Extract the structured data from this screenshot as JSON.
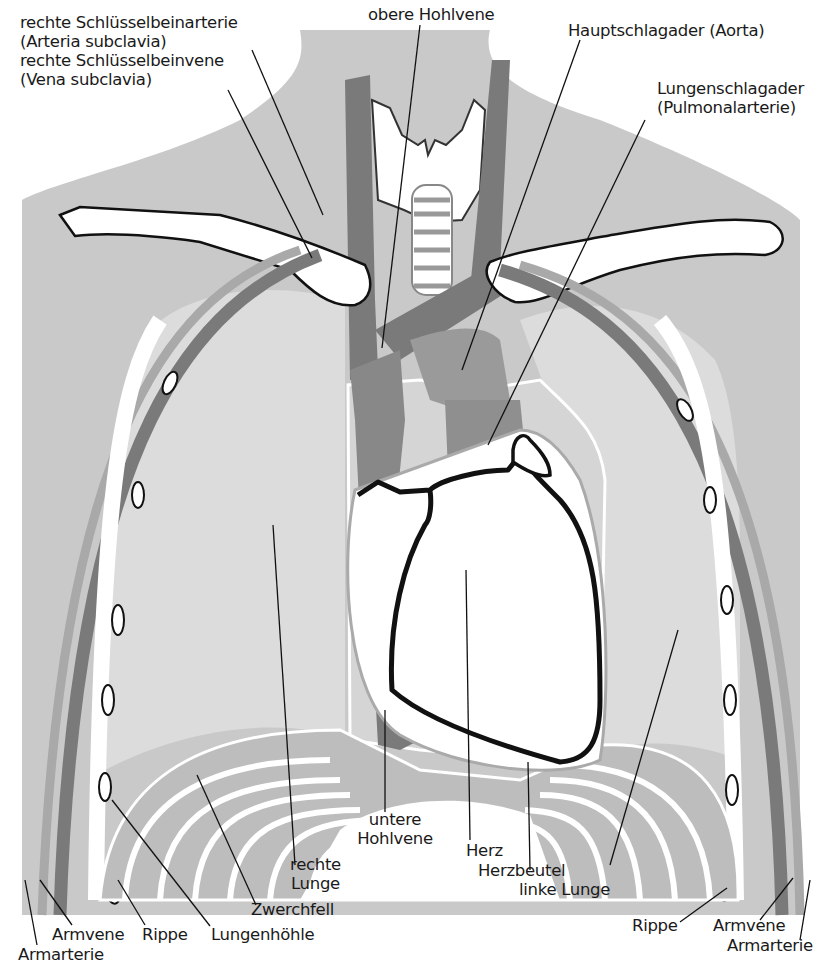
{
  "diagram": {
    "colors": {
      "background": "#ffffff",
      "body": "#c9c9c9",
      "lung": "#dcdcdc",
      "vein": "#7a7a7a",
      "artery": "#a9a9a9",
      "bone": "#ffffff",
      "outline": "#111111",
      "diaphragm_band": "#bdbdbd"
    },
    "labels": {
      "subclavian_artery": {
        "line1": "rechte Schlüsselbeinarterie",
        "line2": "(Arteria subclavia)"
      },
      "subclavian_vein": {
        "line1": "rechte Schlüsselbeinvene",
        "line2": "(Vena subclavia)"
      },
      "superior_vena_cava": {
        "line1": "obere Hohlvene"
      },
      "aorta": {
        "line1": "Hauptschlagader (Aorta)"
      },
      "pulmonary_artery": {
        "line1": "Lungenschlagader",
        "line2": "(Pulmonalarterie)"
      },
      "inferior_vena_cava": {
        "line1": "untere",
        "line2": "Hohlvene"
      },
      "heart": {
        "line1": "Herz"
      },
      "pericardium": {
        "line1": "Herzbeutel"
      },
      "right_lung": {
        "line1": "rechte",
        "line2": "Lunge"
      },
      "left_lung": {
        "line1": "linke Lunge"
      },
      "diaphragm": {
        "line1": "Zwerchfell"
      },
      "pleural_cavity": {
        "line1": "Lungenhöhle"
      },
      "rib_left": {
        "line1": "Rippe"
      },
      "rib_right": {
        "line1": "Rippe"
      },
      "arm_vein_left": {
        "line1": "Armvene"
      },
      "arm_vein_right": {
        "line1": "Armvene"
      },
      "arm_artery_left": {
        "line1": "Armarterie"
      },
      "arm_artery_right": {
        "line1": "Armarterie"
      }
    }
  }
}
